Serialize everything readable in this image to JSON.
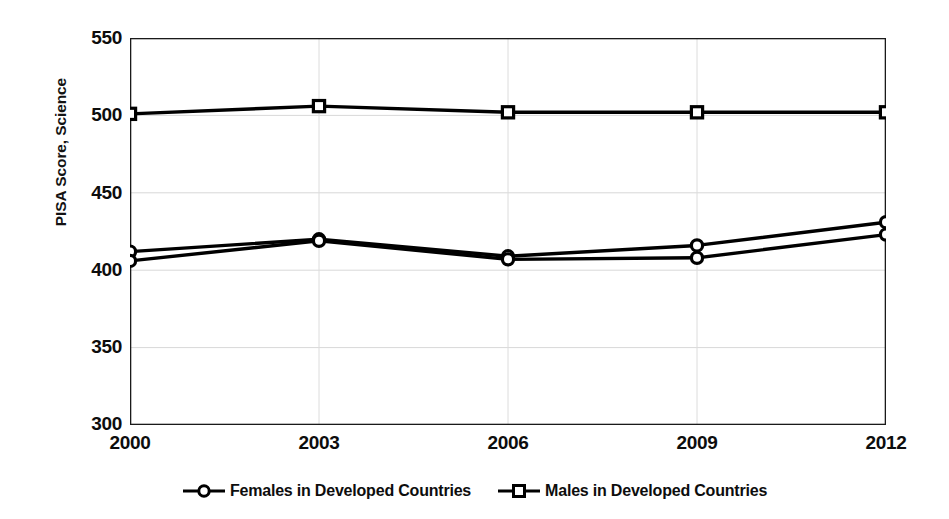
{
  "chart_data": {
    "type": "line",
    "title": "",
    "xlabel": "",
    "ylabel": "PISA Score, Science",
    "categories": [
      "2000",
      "2003",
      "2006",
      "2009",
      "2012"
    ],
    "x": [
      2000,
      2003,
      2006,
      2009,
      2012
    ],
    "xlim": [
      2000,
      2012
    ],
    "ylim": [
      300,
      550
    ],
    "yticks": [
      "300",
      "350",
      "400",
      "450",
      "500",
      "550"
    ],
    "ytick_values": [
      300,
      350,
      400,
      450,
      500,
      550
    ],
    "grid": "horizontal-and-vertical-light",
    "legend_position": "bottom-center",
    "series": [
      {
        "name": "Females in Developed Countries",
        "marker": "circle",
        "color": "#000000",
        "values": [
          412,
          420,
          409,
          416,
          431
        ]
      },
      {
        "name": "Males in Developed Countries",
        "marker": "square",
        "color": "#000000",
        "values": [
          501,
          506,
          502,
          502,
          502
        ]
      },
      {
        "name": "",
        "marker": "circle",
        "color": "#000000",
        "values": [
          406,
          419,
          407,
          408,
          423
        ]
      }
    ]
  },
  "axes": {
    "y_title": "PISA Score, Science",
    "y_ticks": [
      "550",
      "500",
      "450",
      "400",
      "350",
      "300"
    ],
    "x_ticks": [
      "2000",
      "2003",
      "2006",
      "2009",
      "2012"
    ]
  },
  "legend": {
    "items": [
      {
        "label": "Females in Developed Countries",
        "marker": "circle-marker-icon"
      },
      {
        "label": "Males in Developed Countries",
        "marker": "square-marker-icon"
      }
    ]
  }
}
